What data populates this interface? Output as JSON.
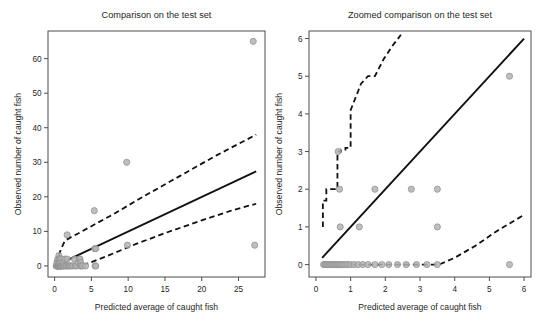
{
  "figure": {
    "background": "#ffffff",
    "point_color": "#b4b4b4",
    "point_edge_color": "#8c8c8c",
    "line_color": "#111111",
    "axis_color": "#4d4d4d",
    "panel_count": 2
  },
  "chart_data": [
    {
      "type": "scatter",
      "panel": "left",
      "title": "Comparison on the test set",
      "xlabel": "Predicted average of caught fish",
      "ylabel": "Observed number of caught fish",
      "xlim": [
        -0.9,
        28.6
      ],
      "ylim": [
        -3.2,
        68.0
      ],
      "xticks": [
        0,
        5,
        10,
        15,
        20,
        25
      ],
      "yticks": [
        0,
        10,
        20,
        30,
        40,
        50,
        60
      ],
      "grid": false,
      "legend": null,
      "points": [
        [
          0.22,
          0.0
        ],
        [
          0.28,
          0.0
        ],
        [
          0.3,
          1.0
        ],
        [
          0.33,
          0.0
        ],
        [
          0.36,
          0.0
        ],
        [
          0.4,
          0.0
        ],
        [
          0.42,
          2.0
        ],
        [
          0.45,
          0.0
        ],
        [
          0.48,
          1.0
        ],
        [
          0.52,
          0.0
        ],
        [
          0.55,
          0.0
        ],
        [
          0.58,
          3.0
        ],
        [
          0.6,
          2.0
        ],
        [
          0.63,
          0.0
        ],
        [
          0.66,
          1.0
        ],
        [
          0.7,
          0.0
        ],
        [
          0.72,
          2.0
        ],
        [
          0.75,
          0.0
        ],
        [
          0.78,
          0.0
        ],
        [
          0.82,
          1.0
        ],
        [
          0.86,
          0.0
        ],
        [
          0.9,
          0.0
        ],
        [
          0.95,
          2.0
        ],
        [
          1.0,
          0.0
        ],
        [
          1.05,
          1.0
        ],
        [
          1.1,
          0.0
        ],
        [
          1.2,
          0.0
        ],
        [
          1.25,
          1.0
        ],
        [
          1.3,
          0.0
        ],
        [
          1.4,
          2.0
        ],
        [
          1.5,
          0.0
        ],
        [
          1.6,
          0.0
        ],
        [
          1.7,
          9.0
        ],
        [
          1.7,
          2.0
        ],
        [
          1.8,
          0.0
        ],
        [
          1.95,
          0.0
        ],
        [
          2.1,
          0.0
        ],
        [
          2.3,
          0.0
        ],
        [
          2.5,
          0.0
        ],
        [
          2.7,
          2.0
        ],
        [
          2.8,
          0.0
        ],
        [
          3.0,
          0.0
        ],
        [
          3.2,
          1.0
        ],
        [
          3.4,
          2.0
        ],
        [
          3.45,
          2.0
        ],
        [
          3.5,
          0.0
        ],
        [
          3.55,
          1.0
        ],
        [
          3.6,
          0.0
        ],
        [
          3.8,
          0.0
        ],
        [
          4.2,
          0.0
        ],
        [
          5.4,
          16.0
        ],
        [
          5.45,
          5.0
        ],
        [
          5.5,
          0.0
        ],
        [
          5.6,
          5.0
        ],
        [
          5.6,
          0.0
        ],
        [
          9.8,
          30.0
        ],
        [
          9.9,
          6.0
        ],
        [
          27.0,
          65.0
        ],
        [
          27.2,
          6.0
        ]
      ],
      "fit_line": {
        "label": "identity / fitted line",
        "x": [
          0.15,
          27.4
        ],
        "y": [
          0.1,
          27.4
        ]
      },
      "ci_upper": {
        "label": "upper prediction band",
        "x": [
          0.18,
          0.55,
          0.9,
          1.4,
          2.1,
          3.2,
          5.0,
          8.0,
          12.0,
          17.0,
          22.0,
          27.4
        ],
        "y": [
          0.6,
          3.0,
          5.0,
          7.3,
          8.2,
          9.4,
          11.5,
          15.0,
          20.0,
          26.0,
          32.0,
          38.0
        ]
      },
      "ci_lower": {
        "label": "lower prediction band",
        "x": [
          0.18,
          1.2,
          2.4,
          3.6,
          5.0,
          7.5,
          11.0,
          15.0,
          20.0,
          24.0,
          27.4
        ],
        "y": [
          0.0,
          0.0,
          0.0,
          0.1,
          1.1,
          3.2,
          6.3,
          9.5,
          13.2,
          16.0,
          18.0
        ]
      }
    },
    {
      "type": "scatter",
      "panel": "right",
      "title": "Zoomed comparison on the test set",
      "xlabel": "Predicted average of caught fish",
      "ylabel": "Observed number of caught fish",
      "xlim": [
        -0.2,
        6.2
      ],
      "ylim": [
        -0.33,
        6.2
      ],
      "xticks": [
        0,
        1,
        2,
        3,
        4,
        5,
        6
      ],
      "yticks": [
        0,
        1,
        2,
        3,
        4,
        5,
        6
      ],
      "grid": false,
      "legend": null,
      "points": [
        [
          0.22,
          0.0
        ],
        [
          0.26,
          0.0
        ],
        [
          0.3,
          0.0
        ],
        [
          0.34,
          0.0
        ],
        [
          0.38,
          0.0
        ],
        [
          0.42,
          0.0
        ],
        [
          0.46,
          0.0
        ],
        [
          0.5,
          0.0
        ],
        [
          0.54,
          0.0
        ],
        [
          0.58,
          0.0
        ],
        [
          0.62,
          0.0
        ],
        [
          0.66,
          0.0
        ],
        [
          0.7,
          0.0
        ],
        [
          0.74,
          0.0
        ],
        [
          0.8,
          0.0
        ],
        [
          0.86,
          0.0
        ],
        [
          0.92,
          0.0
        ],
        [
          1.0,
          0.0
        ],
        [
          1.1,
          0.0
        ],
        [
          1.22,
          0.0
        ],
        [
          1.35,
          0.0
        ],
        [
          1.5,
          0.0
        ],
        [
          1.7,
          0.0
        ],
        [
          1.9,
          0.0
        ],
        [
          2.1,
          0.0
        ],
        [
          2.35,
          0.0
        ],
        [
          2.6,
          0.0
        ],
        [
          2.9,
          0.0
        ],
        [
          3.2,
          0.0
        ],
        [
          3.5,
          0.0
        ],
        [
          5.58,
          0.0
        ],
        [
          0.7,
          1.0
        ],
        [
          1.25,
          1.0
        ],
        [
          3.5,
          1.0
        ],
        [
          0.68,
          2.0
        ],
        [
          1.7,
          2.0
        ],
        [
          2.75,
          2.0
        ],
        [
          3.5,
          2.0
        ],
        [
          0.64,
          3.0
        ],
        [
          5.58,
          5.0
        ]
      ],
      "fit_line": {
        "label": "identity / fitted line",
        "x": [
          0.18,
          6.0
        ],
        "y": [
          0.18,
          6.0
        ]
      },
      "ci_upper": {
        "label": "upper prediction band",
        "x": [
          0.2,
          0.2,
          0.3,
          0.3,
          0.45,
          0.45,
          0.62,
          0.62,
          0.72,
          0.72,
          0.85,
          0.85,
          1.0,
          1.0,
          1.15,
          1.3,
          1.5,
          1.7,
          1.95,
          2.2,
          2.45
        ],
        "y": [
          1.0,
          1.7,
          1.7,
          2.0,
          2.0,
          2.0,
          2.0,
          3.0,
          3.0,
          3.05,
          3.05,
          3.1,
          3.1,
          4.1,
          4.45,
          4.8,
          5.0,
          5.0,
          5.45,
          5.8,
          6.1
        ]
      },
      "ci_lower": {
        "label": "lower prediction band",
        "x": [
          0.2,
          1.0,
          2.0,
          3.0,
          3.55,
          4.0,
          4.6,
          5.2,
          6.0
        ],
        "y": [
          0.0,
          0.0,
          0.0,
          0.0,
          0.0,
          0.18,
          0.5,
          0.88,
          1.32
        ]
      }
    }
  ]
}
